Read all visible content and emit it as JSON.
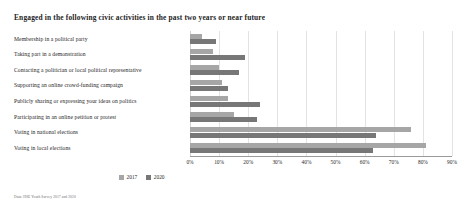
{
  "chart_data": {
    "type": "bar",
    "orientation": "horizontal",
    "title": "Engaged in the following civic activities in the past two years or near future",
    "xlabel": "",
    "ylabel": "",
    "xlim": [
      0,
      90
    ],
    "xticks": [
      "0%",
      "10%",
      "20%",
      "30%",
      "40%",
      "50%",
      "60%",
      "70%",
      "80%",
      "90%"
    ],
    "xtick_values": [
      0,
      10,
      20,
      30,
      40,
      50,
      60,
      70,
      80,
      90
    ],
    "grid": true,
    "legend_position": "bottom",
    "categories": [
      "Membership in a political party",
      "Taking part in a demonstration",
      "Contacting a politician or local political representative",
      "Supporting an online crowd-funding campaign",
      "Publicly sharing or expressing your ideas on politics",
      "Participating in an online petition or protest",
      "Voting in national elections",
      "Voting in local elections"
    ],
    "series": [
      {
        "name": "2017",
        "color": "#a6a6a6",
        "values": [
          4,
          8,
          10,
          11,
          13,
          15,
          76,
          81
        ]
      },
      {
        "name": "2020",
        "color": "#777777",
        "values": [
          9,
          19,
          17,
          13,
          24,
          23,
          64,
          63
        ]
      }
    ],
    "note": "Data: HSE Youth Survey 2017 and 2020"
  }
}
